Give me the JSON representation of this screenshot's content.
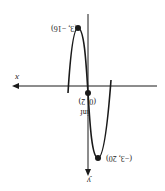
{
  "diagram": {
    "orientation": "rotated 180 degrees",
    "axes": {
      "x_label": "x",
      "y_label": "y"
    },
    "points": [
      {
        "name": "local-max",
        "label": "(3, −16)"
      },
      {
        "name": "inflection",
        "label": "(0, 2)",
        "sublabel": "inf"
      },
      {
        "name": "local-min",
        "label": "(−3, 20)"
      }
    ],
    "colors": {
      "ink": "#1a1a1a",
      "background": "#ffffff"
    }
  }
}
